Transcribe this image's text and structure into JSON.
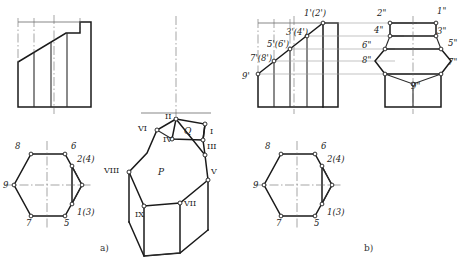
{
  "figure": {
    "subfigures": [
      {
        "key": "a",
        "label": "a)"
      },
      {
        "key": "b",
        "label": "b)"
      }
    ]
  },
  "colors": {
    "outline": "#1a1a1a",
    "thin": "#555555",
    "center_line": "#666666",
    "projection_line": "#999999",
    "vertex_fill": "#ffffff",
    "text": "#1a1a1a",
    "background": "#ffffff"
  },
  "subfigure_a": {
    "front_view": {
      "name": "front-view-a",
      "description": "rectangular front view with oblique cut and stepped notch at top right"
    },
    "top_view": {
      "name": "top-view-hexagon-a",
      "vertex_labels": [
        {
          "id": "v8",
          "text": "8",
          "x": 15,
          "y": 147
        },
        {
          "id": "v6",
          "text": "6",
          "x": 71,
          "y": 147
        },
        {
          "id": "v2",
          "text": "2(4)",
          "x": 85,
          "y": 159
        },
        {
          "id": "v9",
          "text": "9",
          "x": 2,
          "y": 186
        },
        {
          "id": "v1",
          "text": "1(3)",
          "x": 85,
          "y": 216
        },
        {
          "id": "v7",
          "text": "7",
          "x": 15,
          "y": 229
        },
        {
          "id": "v5",
          "text": "5",
          "x": 71,
          "y": 229
        }
      ]
    },
    "pictorial": {
      "name": "pictorial-solid",
      "vertex_labels": [
        {
          "id": "I",
          "text": "I",
          "x": 205,
          "y": 136
        },
        {
          "id": "II",
          "text": "II",
          "x": 166,
          "y": 117
        },
        {
          "id": "III",
          "text": "III",
          "x": 207,
          "y": 150
        },
        {
          "id": "IV",
          "text": "IV",
          "x": 164,
          "y": 141
        },
        {
          "id": "V",
          "text": "V",
          "x": 211,
          "y": 173
        },
        {
          "id": "VI",
          "text": "VI",
          "x": 140,
          "y": 131
        },
        {
          "id": "VII",
          "text": "VII",
          "x": 178,
          "y": 210
        },
        {
          "id": "VIII",
          "text": "VIII",
          "x": 104,
          "y": 172
        },
        {
          "id": "IX",
          "text": "IX",
          "x": 134,
          "y": 220
        }
      ],
      "face_labels": [
        {
          "id": "P",
          "text": "P",
          "x": 161,
          "y": 173
        },
        {
          "id": "Q",
          "text": "Q",
          "x": 187,
          "y": 133
        }
      ]
    }
  },
  "subfigure_b": {
    "front_view": {
      "name": "front-view-b",
      "vertex_labels": [
        {
          "id": "p1",
          "text": "1'(2')",
          "x": 305,
          "y": 12
        },
        {
          "id": "p3",
          "text": "3'(4')",
          "x": 288,
          "y": 32
        },
        {
          "id": "p5",
          "text": "5'(6')",
          "x": 272,
          "y": 44
        },
        {
          "id": "p7",
          "text": "7'(8')",
          "x": 254,
          "y": 59
        },
        {
          "id": "p9",
          "text": "9'",
          "x": 238,
          "y": 77
        }
      ]
    },
    "side_view": {
      "name": "side-view-b",
      "vertex_labels": [
        {
          "id": "s2",
          "text": "2\"",
          "x": 375,
          "y": 12
        },
        {
          "id": "s1",
          "text": "1\"",
          "x": 434,
          "y": 10
        },
        {
          "id": "s4",
          "text": "4\"",
          "x": 371,
          "y": 29
        },
        {
          "id": "s3",
          "text": "3\"",
          "x": 433,
          "y": 30
        },
        {
          "id": "s6",
          "text": "6\"",
          "x": 355,
          "y": 45
        },
        {
          "id": "s5",
          "text": "5\"",
          "x": 443,
          "y": 42
        },
        {
          "id": "s8",
          "text": "8\"",
          "x": 356,
          "y": 60
        },
        {
          "id": "s7",
          "text": "7\"",
          "x": 444,
          "y": 62
        },
        {
          "id": "s9",
          "text": "9\"",
          "x": 408,
          "y": 81
        }
      ]
    },
    "top_view": {
      "name": "top-view-hexagon-b",
      "vertex_labels": [
        {
          "id": "v8",
          "text": "8",
          "x": 265,
          "y": 147
        },
        {
          "id": "v6",
          "text": "6",
          "x": 320,
          "y": 147
        },
        {
          "id": "v2",
          "text": "2(4)",
          "x": 334,
          "y": 159
        },
        {
          "id": "v9",
          "text": "9",
          "x": 251,
          "y": 186
        },
        {
          "id": "v1",
          "text": "1(3)",
          "x": 334,
          "y": 216
        },
        {
          "id": "v7",
          "text": "7",
          "x": 265,
          "y": 229
        },
        {
          "id": "v5",
          "text": "5",
          "x": 320,
          "y": 229
        }
      ]
    }
  }
}
